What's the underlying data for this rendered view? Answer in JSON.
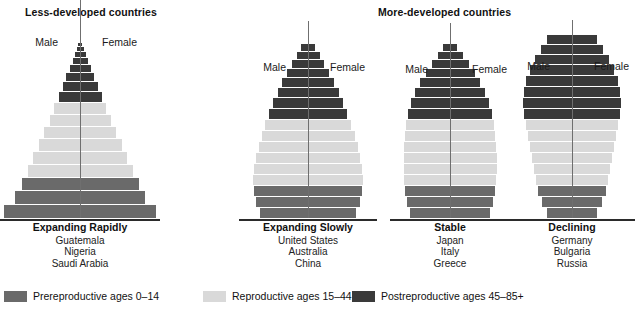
{
  "groups": [
    {
      "id": "less-developed",
      "label": "Less-developed countries"
    },
    {
      "id": "more-developed",
      "label": "More-developed countries"
    }
  ],
  "axis_labels": {
    "male": "Male",
    "female": "Female"
  },
  "legend": {
    "items": [
      {
        "key": "prereproductive",
        "label": "Prereproductive ages 0–14",
        "color": "#6a6a6a"
      },
      {
        "key": "reproductive",
        "label": "Reproductive ages 15–44",
        "color": "#d9d9d9"
      },
      {
        "key": "postreproductive",
        "label": "Postreproductive ages 45–85+",
        "color": "#3a3a3a"
      }
    ]
  },
  "colors": {
    "prereproductive": "#6a6a6a",
    "reproductive": "#d9d9d9",
    "postreproductive": "#3a3a3a",
    "axis": "#6f6f6f",
    "baseline": "#2b2b2b",
    "background": "#ffffff",
    "text": "#1a1a1a"
  },
  "chart_data": {
    "type": "bar",
    "subtitle": "Generalized population age structure of less-developed and more-developed countries",
    "xlabel": "",
    "ylabel": "",
    "orientation": "horizontal-bidirectional",
    "note": "Each bar is a 5-year age cohort; width is the percentage of population, mirrored left (Male) and right (Female). Widths below are relative to panel width.",
    "age_bands": [
      "Prereproductive ages 0–14",
      "Reproductive ages 15–44",
      "Postreproductive ages 45–85+"
    ],
    "pyramids": [
      {
        "id": "expanding-rapidly",
        "group": "less-developed",
        "title": "Expanding Rapidly",
        "countries": [
          "Guatemala",
          "Nigeria",
          "Saudi Arabia"
        ],
        "axis_overshoot": 46,
        "bars": [
          {
            "cohort": "0–4",
            "band": "prereproductive",
            "width": 152,
            "height": 14
          },
          {
            "cohort": "5–9",
            "band": "prereproductive",
            "width": 130,
            "height": 14
          },
          {
            "cohort": "10–14",
            "band": "prereproductive",
            "width": 117,
            "height": 13
          },
          {
            "cohort": "15–19",
            "band": "reproductive",
            "width": 105,
            "height": 13
          },
          {
            "cohort": "20–24",
            "band": "reproductive",
            "width": 94,
            "height": 13
          },
          {
            "cohort": "25–29",
            "band": "reproductive",
            "width": 83,
            "height": 13
          },
          {
            "cohort": "30–34",
            "band": "reproductive",
            "width": 72,
            "height": 12
          },
          {
            "cohort": "35–39",
            "band": "reproductive",
            "width": 61,
            "height": 12
          },
          {
            "cohort": "40–44",
            "band": "reproductive",
            "width": 52,
            "height": 12
          },
          {
            "cohort": "45–49",
            "band": "postreproductive",
            "width": 43,
            "height": 11
          },
          {
            "cohort": "50–54",
            "band": "postreproductive",
            "width": 35,
            "height": 10
          },
          {
            "cohort": "55–59",
            "band": "postreproductive",
            "width": 28,
            "height": 9
          },
          {
            "cohort": "60–64",
            "band": "postreproductive",
            "width": 21,
            "height": 8
          },
          {
            "cohort": "65–69",
            "band": "postreproductive",
            "width": 15,
            "height": 7
          },
          {
            "cohort": "70–74",
            "band": "postreproductive",
            "width": 11,
            "height": 6
          },
          {
            "cohort": "75–79",
            "band": "postreproductive",
            "width": 7,
            "height": 5
          },
          {
            "cohort": "80–85+",
            "band": "postreproductive",
            "width": 4,
            "height": 4
          }
        ]
      },
      {
        "id": "expanding-slowly",
        "group": "less-developed",
        "title": "Expanding Slowly",
        "countries": [
          "United States",
          "Australia",
          "China"
        ],
        "axis_overshoot": 22,
        "bars": [
          {
            "cohort": "0–4",
            "band": "prereproductive",
            "width": 96,
            "height": 11
          },
          {
            "cohort": "5–9",
            "band": "prereproductive",
            "width": 104,
            "height": 11
          },
          {
            "cohort": "10–14",
            "band": "prereproductive",
            "width": 108,
            "height": 11
          },
          {
            "cohort": "15–19",
            "band": "reproductive",
            "width": 110,
            "height": 11
          },
          {
            "cohort": "20–24",
            "band": "reproductive",
            "width": 108,
            "height": 11
          },
          {
            "cohort": "25–29",
            "band": "reproductive",
            "width": 104,
            "height": 11
          },
          {
            "cohort": "30–34",
            "band": "reproductive",
            "width": 99,
            "height": 11
          },
          {
            "cohort": "35–39",
            "band": "reproductive",
            "width": 93,
            "height": 11
          },
          {
            "cohort": "40–44",
            "band": "reproductive",
            "width": 86,
            "height": 11
          },
          {
            "cohort": "45–49",
            "band": "postreproductive",
            "width": 78,
            "height": 11
          },
          {
            "cohort": "50–54",
            "band": "postreproductive",
            "width": 70,
            "height": 11
          },
          {
            "cohort": "55–59",
            "band": "postreproductive",
            "width": 61,
            "height": 10
          },
          {
            "cohort": "60–64",
            "band": "postreproductive",
            "width": 52,
            "height": 10
          },
          {
            "cohort": "65–69",
            "band": "postreproductive",
            "width": 42,
            "height": 9
          },
          {
            "cohort": "70–74",
            "band": "postreproductive",
            "width": 32,
            "height": 9
          },
          {
            "cohort": "75–79",
            "band": "postreproductive",
            "width": 23,
            "height": 8
          },
          {
            "cohort": "80–85+",
            "band": "postreproductive",
            "width": 14,
            "height": 8
          }
        ]
      },
      {
        "id": "stable",
        "group": "more-developed",
        "title": "Stable",
        "countries": [
          "Japan",
          "Italy",
          "Greece"
        ],
        "axis_overshoot": 20,
        "bars": [
          {
            "cohort": "0–4",
            "band": "prereproductive",
            "width": 80,
            "height": 11
          },
          {
            "cohort": "5–9",
            "band": "prereproductive",
            "width": 86,
            "height": 11
          },
          {
            "cohort": "10–14",
            "band": "prereproductive",
            "width": 90,
            "height": 11
          },
          {
            "cohort": "15–19",
            "band": "reproductive",
            "width": 92,
            "height": 11
          },
          {
            "cohort": "20–24",
            "band": "reproductive",
            "width": 93,
            "height": 11
          },
          {
            "cohort": "25–29",
            "band": "reproductive",
            "width": 93,
            "height": 11
          },
          {
            "cohort": "30–34",
            "band": "reproductive",
            "width": 92,
            "height": 11
          },
          {
            "cohort": "35–39",
            "band": "reproductive",
            "width": 90,
            "height": 11
          },
          {
            "cohort": "40–44",
            "band": "reproductive",
            "width": 88,
            "height": 11
          },
          {
            "cohort": "45–49",
            "band": "postreproductive",
            "width": 84,
            "height": 11
          },
          {
            "cohort": "50–54",
            "band": "postreproductive",
            "width": 78,
            "height": 11
          },
          {
            "cohort": "55–59",
            "band": "postreproductive",
            "width": 70,
            "height": 10
          },
          {
            "cohort": "60–64",
            "band": "postreproductive",
            "width": 60,
            "height": 10
          },
          {
            "cohort": "65–69",
            "band": "postreproductive",
            "width": 49,
            "height": 9
          },
          {
            "cohort": "70–74",
            "band": "postreproductive",
            "width": 37,
            "height": 9
          },
          {
            "cohort": "75–79",
            "band": "postreproductive",
            "width": 25,
            "height": 8
          },
          {
            "cohort": "80–85+",
            "band": "postreproductive",
            "width": 14,
            "height": 8
          }
        ]
      },
      {
        "id": "declining",
        "group": "more-developed",
        "title": "Declining",
        "countries": [
          "Germany",
          "Bulgaria",
          "Russia"
        ],
        "axis_overshoot": 14,
        "bars": [
          {
            "cohort": "0–4",
            "band": "prereproductive",
            "width": 50,
            "height": 11
          },
          {
            "cohort": "5–9",
            "band": "prereproductive",
            "width": 60,
            "height": 11
          },
          {
            "cohort": "10–14",
            "band": "prereproductive",
            "width": 68,
            "height": 11
          },
          {
            "cohort": "15–19",
            "band": "reproductive",
            "width": 72,
            "height": 11
          },
          {
            "cohort": "20–24",
            "band": "reproductive",
            "width": 76,
            "height": 11
          },
          {
            "cohort": "25–29",
            "band": "reproductive",
            "width": 80,
            "height": 11
          },
          {
            "cohort": "30–34",
            "band": "reproductive",
            "width": 84,
            "height": 11
          },
          {
            "cohort": "35–39",
            "band": "reproductive",
            "width": 88,
            "height": 11
          },
          {
            "cohort": "40–44",
            "band": "reproductive",
            "width": 92,
            "height": 11
          },
          {
            "cohort": "45–49",
            "band": "postreproductive",
            "width": 96,
            "height": 11
          },
          {
            "cohort": "50–54",
            "band": "postreproductive",
            "width": 98,
            "height": 11
          },
          {
            "cohort": "55–59",
            "band": "postreproductive",
            "width": 96,
            "height": 11
          },
          {
            "cohort": "60–64",
            "band": "postreproductive",
            "width": 92,
            "height": 11
          },
          {
            "cohort": "65–69",
            "band": "postreproductive",
            "width": 84,
            "height": 11
          },
          {
            "cohort": "70–74",
            "band": "postreproductive",
            "width": 74,
            "height": 10
          },
          {
            "cohort": "75–79",
            "band": "postreproductive",
            "width": 62,
            "height": 10
          },
          {
            "cohort": "80–85+",
            "band": "postreproductive",
            "width": 50,
            "height": 10
          }
        ]
      }
    ]
  }
}
